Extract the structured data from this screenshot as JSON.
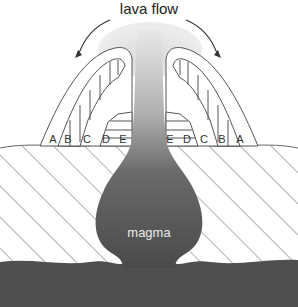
{
  "diagram": {
    "title": "lava flow",
    "magma_label": "magma",
    "left_layers": [
      "A",
      "B",
      "C",
      "D",
      "E"
    ],
    "right_layers": [
      "E",
      "D",
      "C",
      "B",
      "A"
    ],
    "colors": {
      "magma": "#4a4a4a",
      "bedrock": "#4f4f4f",
      "lava_plume": "#d8d8d8",
      "outline": "#555555",
      "hatch": "#666666"
    }
  }
}
